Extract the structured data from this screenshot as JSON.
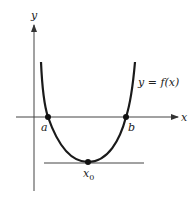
{
  "diagram": {
    "type": "function-graph",
    "axes": {
      "x_label": "x",
      "y_label": "y"
    },
    "curve": {
      "label": "y = f(x)",
      "shape": "U-shaped convex curve"
    },
    "points": [
      {
        "id": "a",
        "label": "a",
        "description": "left x-intercept"
      },
      {
        "id": "b",
        "label": "b",
        "description": "right x-intercept"
      },
      {
        "id": "x0",
        "label": "x",
        "subscript": "0",
        "description": "minimum point with horizontal tangent"
      }
    ],
    "tangent_line": {
      "description": "horizontal tangent at minimum"
    },
    "colors": {
      "ink": "#222222",
      "axis": "#444444",
      "background": "#ffffff"
    }
  }
}
